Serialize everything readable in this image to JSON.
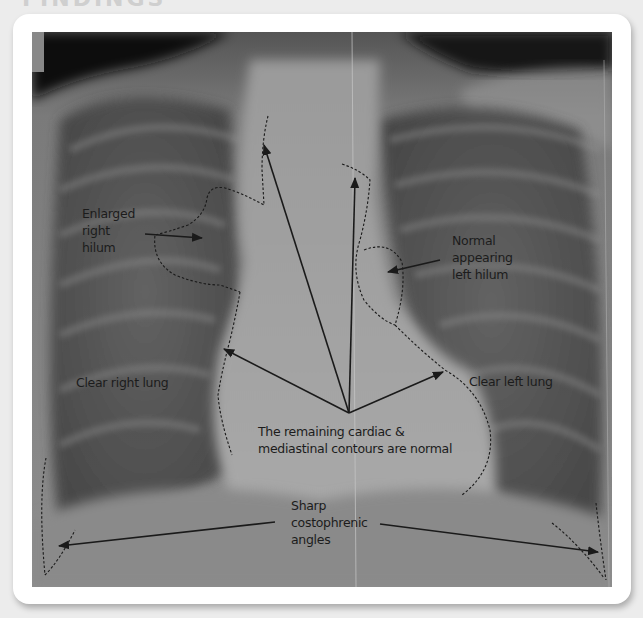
{
  "page": {
    "title_partial": "FINDINGS"
  },
  "figure": {
    "type": "annotated chest x-ray (PA view)",
    "background_color": "#ececec",
    "card_color": "#ffffff",
    "annotation_color": "#1a1a1a",
    "labels": {
      "enlarged_right_hilum": [
        "Enlarged",
        "right",
        "hilum"
      ],
      "normal_left_hilum": [
        "Normal",
        "appearing",
        "left hilum"
      ],
      "clear_right_lung": "Clear right lung",
      "clear_left_lung": "Clear left lung",
      "cardiac_contours": [
        "The remaining cardiac &",
        "mediastinal contours are normal"
      ],
      "costophrenic": [
        "Sharp",
        "costophrenic",
        "angles"
      ]
    }
  }
}
